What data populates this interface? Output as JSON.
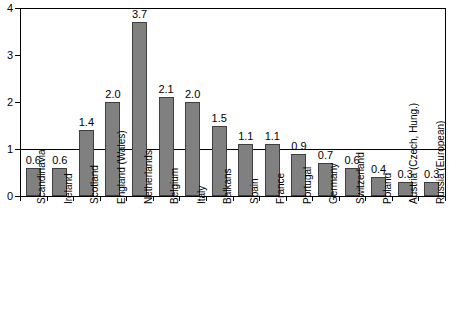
{
  "chart_data": {
    "type": "bar",
    "title": "",
    "subtitle": "",
    "xlabel": "",
    "ylabel": "",
    "ylim": [
      0,
      4
    ],
    "y_ticks": [
      "0",
      "1",
      "2",
      "3",
      "4"
    ],
    "y_tick_values": [
      0,
      1,
      2,
      3,
      4
    ],
    "grid": false,
    "legend": "none",
    "reference_line": 1,
    "bar_color": "#808080",
    "bar_edge_color": "#3f3f3f",
    "axis_color": "#000000",
    "categories": [
      "Scandinavia",
      "Ireland",
      "Scotland",
      "England (Wales)",
      "Netherlands",
      "Belgium",
      "Italy",
      "Balkans",
      "Spain",
      "France",
      "Portugal",
      "Germany",
      "Switzerland",
      "Poland",
      "Austria (Czech, Hung.)",
      "Russia (European)"
    ],
    "values": [
      0.6,
      0.6,
      1.4,
      2.0,
      3.7,
      2.1,
      2.0,
      1.5,
      1.1,
      1.1,
      0.9,
      0.7,
      0.6,
      0.4,
      0.3,
      0.3
    ],
    "value_labels": [
      "0.6",
      "0.6",
      "1.4",
      "2.0",
      "3.7",
      "2.1",
      "2.0",
      "1.5",
      "1.1",
      "1.1",
      "0.9",
      "0.7",
      "0.6",
      "0.4",
      "0.3",
      "0.3"
    ]
  }
}
